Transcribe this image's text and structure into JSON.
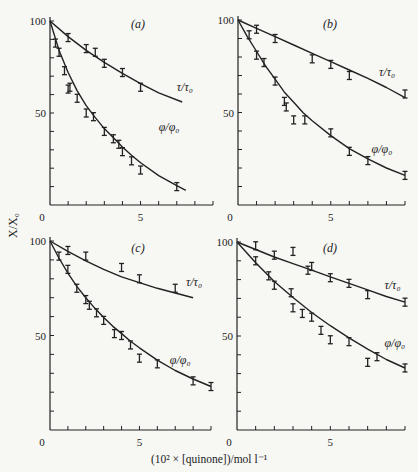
{
  "figure": {
    "ylabel": "X/X₀",
    "xlabel": "(10² × [quinone])/mol l⁻¹",
    "colors": {
      "ink": "#222222",
      "background": "#f7f7f4"
    }
  },
  "chart_data": [
    {
      "type": "scatter",
      "panel": "(a)",
      "xlabel": "(10² × [quinone])/mol l⁻¹",
      "ylabel": "X/X₀",
      "xlim": [
        0,
        9
      ],
      "ylim": [
        0,
        100
      ],
      "x_ticks": [
        0,
        5
      ],
      "y_ticks": [
        50,
        100
      ],
      "series": [
        {
          "name": "τ/τ₀",
          "label_pos": [
            7.0,
            62
          ],
          "x": [
            0,
            1.0,
            2.0,
            2.5,
            3.0,
            4.0,
            5.0
          ],
          "y": [
            100,
            91,
            85,
            83,
            77,
            72,
            64
          ],
          "curve_x": [
            0,
            1,
            2,
            3,
            4,
            5,
            6,
            7.3
          ],
          "curve_y": [
            100,
            91.5,
            84,
            77.5,
            71.5,
            66,
            61,
            56
          ]
        },
        {
          "name": "φ/φ₀",
          "label_pos": [
            6.0,
            40
          ],
          "x": [
            0,
            0.3,
            0.5,
            0.8,
            1.0,
            1.1,
            1.5,
            2.0,
            2.4,
            3.0,
            3.5,
            3.8,
            4.0,
            4.5,
            5.0,
            7.0
          ],
          "y": [
            100,
            88,
            83,
            73,
            63,
            64,
            58,
            50,
            48,
            40,
            36,
            33,
            29,
            24,
            19,
            10
          ],
          "curve_x": [
            0,
            0.5,
            1,
            1.5,
            2,
            2.5,
            3,
            3.5,
            4,
            4.5,
            5,
            6,
            7,
            7.5
          ],
          "curve_y": [
            100,
            84,
            72,
            62,
            54,
            47.5,
            41.5,
            36.5,
            31.5,
            27,
            23,
            16,
            10.5,
            8
          ]
        }
      ]
    },
    {
      "type": "scatter",
      "panel": "(b)",
      "xlabel": "(10² × [quinone])/mol l⁻¹",
      "ylabel": "X/X₀",
      "xlim": [
        0,
        9
      ],
      "ylim": [
        0,
        100
      ],
      "x_ticks": [
        0,
        5
      ],
      "y_ticks": [
        50,
        100
      ],
      "series": [
        {
          "name": "τ/τ₀",
          "label_pos": [
            7.6,
            70
          ],
          "x": [
            0,
            1.0,
            2.0,
            4.0,
            5.0,
            6.0,
            9.0
          ],
          "y": [
            100,
            95,
            90,
            79,
            76,
            70,
            60
          ],
          "curve_x": [
            0,
            1,
            2,
            3,
            4,
            5,
            6,
            7,
            8,
            9
          ],
          "curve_y": [
            100,
            95.5,
            91,
            86.5,
            82,
            77.5,
            73,
            68.5,
            63.5,
            58
          ]
        },
        {
          "name": "φ/φ₀",
          "label_pos": [
            7.2,
            28
          ],
          "x": [
            0,
            0.6,
            1.0,
            1.4,
            2.0,
            2.5,
            2.6,
            3.0,
            3.6,
            5.0,
            6.0,
            7.0,
            9.0
          ],
          "y": [
            100,
            92,
            81,
            77,
            67,
            56,
            53,
            46,
            46,
            39,
            29,
            24,
            16
          ],
          "curve_x": [
            0,
            0.5,
            1,
            1.5,
            2,
            2.5,
            3,
            3.5,
            4,
            5,
            6,
            7,
            8,
            9
          ],
          "curve_y": [
            100,
            91,
            83,
            75,
            68,
            61,
            55.5,
            50,
            45.5,
            37.5,
            30.5,
            25,
            20,
            16
          ]
        }
      ]
    },
    {
      "type": "scatter",
      "panel": "(c)",
      "xlabel": "(10² × [quinone])/mol l⁻¹",
      "ylabel": "X/X₀",
      "xlim": [
        0,
        9
      ],
      "ylim": [
        0,
        100
      ],
      "x_ticks": [
        0,
        5
      ],
      "y_ticks": [
        50,
        100
      ],
      "series": [
        {
          "name": "τ/τ₀",
          "label_pos": [
            7.6,
            76
          ],
          "x": [
            0,
            1.0,
            2.0,
            4.0,
            5.0,
            7.0
          ],
          "y": [
            100,
            95,
            92,
            86,
            80,
            75
          ],
          "curve_x": [
            0,
            1,
            2,
            3,
            4,
            5,
            6,
            7,
            8
          ],
          "curve_y": [
            100,
            94.5,
            89.5,
            85,
            81,
            78,
            75,
            72.5,
            70
          ]
        },
        {
          "name": "φ/φ₀",
          "label_pos": [
            6.7,
            35
          ],
          "x": [
            0,
            0.5,
            1.0,
            1.5,
            2.0,
            2.2,
            2.6,
            3.0,
            3.6,
            4.0,
            4.5,
            5.0,
            6.0,
            8.0,
            9.0
          ],
          "y": [
            100,
            92,
            85,
            75,
            69,
            66,
            62,
            58,
            51,
            50,
            45,
            38,
            35,
            26,
            23
          ],
          "curve_x": [
            0,
            0.5,
            1,
            1.5,
            2,
            2.5,
            3,
            3.5,
            4,
            4.5,
            5,
            6,
            7,
            8,
            9
          ],
          "curve_y": [
            100,
            91,
            83,
            76,
            70,
            64.5,
            59.5,
            55,
            51,
            47,
            43.5,
            37,
            31.5,
            27,
            23
          ]
        }
      ]
    },
    {
      "type": "scatter",
      "panel": "(d)",
      "xlabel": "(10² × [quinone])/mol l⁻¹",
      "ylabel": "X/X₀",
      "xlim": [
        0,
        9
      ],
      "ylim": [
        0,
        100
      ],
      "x_ticks": [
        0,
        5
      ],
      "y_ticks": [
        50,
        100
      ],
      "series": [
        {
          "name": "τ/τ₀",
          "label_pos": [
            7.9,
            75
          ],
          "x": [
            0,
            1.0,
            2.0,
            3.0,
            3.8,
            4.0,
            5.0,
            6.0,
            7.0,
            9.0
          ],
          "y": [
            100,
            98,
            93,
            95,
            85,
            87,
            81,
            78,
            72,
            68
          ],
          "curve_x": [
            0,
            1,
            2,
            3,
            4,
            5,
            6,
            7,
            8,
            9
          ],
          "curve_y": [
            100,
            96,
            92,
            88.5,
            85,
            81.5,
            78,
            74.5,
            71,
            68
          ]
        },
        {
          "name": "φ/φ₀",
          "label_pos": [
            7.9,
            44
          ],
          "x": [
            0,
            1.0,
            1.7,
            2.0,
            2.9,
            3.0,
            3.5,
            4.0,
            4.5,
            5.0,
            6.0,
            7.0,
            7.5,
            9.0
          ],
          "y": [
            100,
            90,
            82,
            77,
            73,
            65,
            62,
            60,
            53,
            48,
            47,
            36,
            39,
            33
          ],
          "curve_x": [
            0,
            1,
            2,
            3,
            4,
            5,
            6,
            7,
            8,
            9
          ],
          "curve_y": [
            100,
            89,
            79,
            70.5,
            62.5,
            55.5,
            49,
            43,
            37.5,
            33
          ]
        }
      ]
    }
  ],
  "layout": {
    "panels": [
      {
        "x0": 50,
        "x9": 213,
        "y0": 205,
        "y100": 21,
        "label_x": 138,
        "label_y": 28
      },
      {
        "x0": 238,
        "x9": 405,
        "y0": 205,
        "y100": 20,
        "label_x": 330,
        "label_y": 28
      },
      {
        "x0": 50,
        "x9": 211,
        "y0": 430,
        "y100": 241,
        "label_x": 138,
        "label_y": 252
      },
      {
        "x0": 237,
        "x9": 405,
        "y0": 430,
        "y100": 242,
        "label_x": 330,
        "label_y": 252
      }
    ]
  }
}
